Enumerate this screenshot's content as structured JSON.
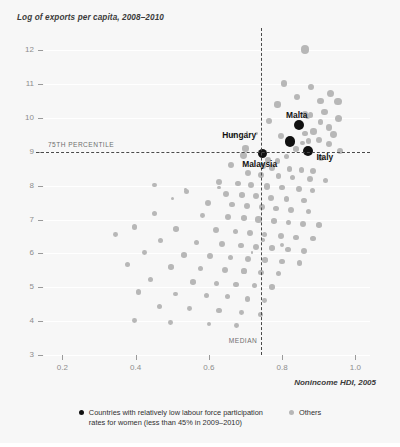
{
  "chart_data": {
    "type": "scatter",
    "title": "Log of exports per capita, 2008–2010",
    "xlabel": "Nonincome HDI, 2005",
    "ylabel": "Log of exports per capita, 2008–2010",
    "xlim": [
      0.15,
      1.04
    ],
    "ylim": [
      3,
      12.3
    ],
    "xticks": [
      "0.2",
      "0.4",
      "0.6",
      "0.8",
      "1.0"
    ],
    "xtick_values": [
      0.2,
      0.4,
      0.6,
      0.8,
      1.0
    ],
    "yticks": [
      "3",
      "4",
      "5",
      "6",
      "7",
      "8",
      "9",
      "10",
      "11",
      "12"
    ],
    "ytick_values": [
      3,
      4,
      5,
      6,
      7,
      8,
      9,
      10,
      11,
      12
    ],
    "grid": "horizontal-faint",
    "legend_position": "bottom-center",
    "reference_lines": [
      {
        "orientation": "horizontal",
        "value": 9.0,
        "label": "75TH PERCENTILE",
        "style": "dashed"
      },
      {
        "orientation": "vertical",
        "value": 0.742,
        "label": "MEDIAN",
        "style": "dashed"
      }
    ],
    "series": [
      {
        "name": "Countries with relatively low labour force participation rates for women (less than 45% in 2009–2010)",
        "color": "#111111",
        "points": [
          {
            "label": "Malta",
            "x": 0.845,
            "y": 9.78,
            "r": 5.0
          },
          {
            "label": "Hungary",
            "x": 0.822,
            "y": 9.3,
            "r": 5.2
          },
          {
            "label": "Italy",
            "x": 0.872,
            "y": 9.03,
            "r": 5.0
          },
          {
            "label": "Malaysia",
            "x": 0.747,
            "y": 8.95,
            "r": 4.8
          }
        ]
      },
      {
        "name": "Others",
        "color": "#b7b7b7",
        "points": [
          {
            "x": 0.862,
            "y": 12.02,
            "r": 4.2
          },
          {
            "x": 0.805,
            "y": 11.02,
            "r": 3.2
          },
          {
            "x": 0.878,
            "y": 10.92,
            "r": 3.0
          },
          {
            "x": 0.932,
            "y": 10.72,
            "r": 3.6
          },
          {
            "x": 0.84,
            "y": 10.62,
            "r": 3.0
          },
          {
            "x": 0.904,
            "y": 10.5,
            "r": 3.4
          },
          {
            "x": 0.952,
            "y": 10.48,
            "r": 3.8
          },
          {
            "x": 0.788,
            "y": 10.4,
            "r": 3.2
          },
          {
            "x": 0.916,
            "y": 10.18,
            "r": 3.2
          },
          {
            "x": 0.862,
            "y": 10.12,
            "r": 3.2
          },
          {
            "x": 0.878,
            "y": 10.08,
            "r": 2.8
          },
          {
            "x": 0.87,
            "y": 10.04,
            "r": 2.6
          },
          {
            "x": 0.955,
            "y": 9.98,
            "r": 3.6
          },
          {
            "x": 0.765,
            "y": 9.92,
            "r": 3.0
          },
          {
            "x": 0.905,
            "y": 9.88,
            "r": 2.6
          },
          {
            "x": 0.928,
            "y": 9.72,
            "r": 3.2
          },
          {
            "x": 0.886,
            "y": 9.6,
            "r": 3.2
          },
          {
            "x": 0.862,
            "y": 9.54,
            "r": 2.8
          },
          {
            "x": 0.94,
            "y": 9.5,
            "r": 3.4
          },
          {
            "x": 0.798,
            "y": 9.46,
            "r": 3.0
          },
          {
            "x": 0.9,
            "y": 9.36,
            "r": 3.0
          },
          {
            "x": 0.872,
            "y": 9.32,
            "r": 2.8
          },
          {
            "x": 0.855,
            "y": 9.26,
            "r": 2.4
          },
          {
            "x": 0.928,
            "y": 9.22,
            "r": 3.0
          },
          {
            "x": 0.7,
            "y": 9.1,
            "r": 3.2
          },
          {
            "x": 0.838,
            "y": 9.08,
            "r": 2.8
          },
          {
            "x": 0.958,
            "y": 9.02,
            "r": 3.0
          },
          {
            "x": 0.694,
            "y": 8.88,
            "r": 3.4
          },
          {
            "x": 0.812,
            "y": 8.86,
            "r": 2.6
          },
          {
            "x": 0.905,
            "y": 8.82,
            "r": 3.0
          },
          {
            "x": 0.762,
            "y": 8.76,
            "r": 3.0
          },
          {
            "x": 0.788,
            "y": 8.72,
            "r": 2.8
          },
          {
            "x": 0.66,
            "y": 8.6,
            "r": 3.0
          },
          {
            "x": 0.748,
            "y": 8.58,
            "r": 2.8
          },
          {
            "x": 0.772,
            "y": 8.54,
            "r": 3.2
          },
          {
            "x": 0.82,
            "y": 8.5,
            "r": 2.8
          },
          {
            "x": 0.852,
            "y": 8.46,
            "r": 2.6
          },
          {
            "x": 0.885,
            "y": 8.42,
            "r": 3.0
          },
          {
            "x": 0.706,
            "y": 8.36,
            "r": 3.0
          },
          {
            "x": 0.742,
            "y": 8.32,
            "r": 3.2
          },
          {
            "x": 0.79,
            "y": 8.28,
            "r": 2.8
          },
          {
            "x": 0.828,
            "y": 8.24,
            "r": 2.6
          },
          {
            "x": 0.876,
            "y": 8.2,
            "r": 3.0
          },
          {
            "x": 0.918,
            "y": 8.16,
            "r": 2.6
          },
          {
            "x": 0.628,
            "y": 8.1,
            "r": 3.2
          },
          {
            "x": 0.68,
            "y": 8.06,
            "r": 2.8
          },
          {
            "x": 0.716,
            "y": 8.02,
            "r": 3.0
          },
          {
            "x": 0.758,
            "y": 7.98,
            "r": 3.2
          },
          {
            "x": 0.8,
            "y": 7.94,
            "r": 2.8
          },
          {
            "x": 0.846,
            "y": 7.9,
            "r": 3.0
          },
          {
            "x": 0.884,
            "y": 7.86,
            "r": 2.6
          },
          {
            "x": 0.54,
            "y": 7.82,
            "r": 2.6
          },
          {
            "x": 0.648,
            "y": 7.76,
            "r": 3.0
          },
          {
            "x": 0.69,
            "y": 7.72,
            "r": 2.8
          },
          {
            "x": 0.73,
            "y": 7.68,
            "r": 3.0
          },
          {
            "x": 0.77,
            "y": 7.64,
            "r": 3.2
          },
          {
            "x": 0.812,
            "y": 7.6,
            "r": 2.8
          },
          {
            "x": 0.86,
            "y": 7.56,
            "r": 2.6
          },
          {
            "x": 0.598,
            "y": 7.48,
            "r": 3.0
          },
          {
            "x": 0.664,
            "y": 7.44,
            "r": 2.8
          },
          {
            "x": 0.704,
            "y": 7.4,
            "r": 3.0
          },
          {
            "x": 0.744,
            "y": 7.36,
            "r": 3.0
          },
          {
            "x": 0.784,
            "y": 7.32,
            "r": 2.8
          },
          {
            "x": 0.824,
            "y": 7.28,
            "r": 3.0
          },
          {
            "x": 0.872,
            "y": 7.24,
            "r": 2.6
          },
          {
            "x": 0.452,
            "y": 7.18,
            "r": 2.6
          },
          {
            "x": 0.582,
            "y": 7.12,
            "r": 2.4
          },
          {
            "x": 0.652,
            "y": 7.08,
            "r": 3.0
          },
          {
            "x": 0.696,
            "y": 7.04,
            "r": 2.8
          },
          {
            "x": 0.736,
            "y": 7.0,
            "r": 3.2
          },
          {
            "x": 0.778,
            "y": 6.96,
            "r": 2.8
          },
          {
            "x": 0.818,
            "y": 6.92,
            "r": 2.6
          },
          {
            "x": 0.856,
            "y": 6.88,
            "r": 3.0
          },
          {
            "x": 0.9,
            "y": 6.84,
            "r": 2.8
          },
          {
            "x": 0.398,
            "y": 6.78,
            "r": 2.6
          },
          {
            "x": 0.51,
            "y": 6.72,
            "r": 2.8
          },
          {
            "x": 0.62,
            "y": 6.68,
            "r": 3.0
          },
          {
            "x": 0.672,
            "y": 6.64,
            "r": 2.6
          },
          {
            "x": 0.712,
            "y": 6.6,
            "r": 3.0
          },
          {
            "x": 0.752,
            "y": 6.56,
            "r": 2.8
          },
          {
            "x": 0.796,
            "y": 6.52,
            "r": 3.0
          },
          {
            "x": 0.838,
            "y": 6.48,
            "r": 2.6
          },
          {
            "x": 0.884,
            "y": 6.44,
            "r": 2.8
          },
          {
            "x": 0.468,
            "y": 6.38,
            "r": 2.6
          },
          {
            "x": 0.566,
            "y": 6.32,
            "r": 2.8
          },
          {
            "x": 0.636,
            "y": 6.28,
            "r": 3.0
          },
          {
            "x": 0.688,
            "y": 6.24,
            "r": 2.6
          },
          {
            "x": 0.728,
            "y": 6.2,
            "r": 3.0
          },
          {
            "x": 0.772,
            "y": 6.16,
            "r": 2.8
          },
          {
            "x": 0.816,
            "y": 6.12,
            "r": 2.6
          },
          {
            "x": 0.86,
            "y": 6.08,
            "r": 3.0
          },
          {
            "x": 0.424,
            "y": 6.02,
            "r": 2.4
          },
          {
            "x": 0.532,
            "y": 5.96,
            "r": 2.8
          },
          {
            "x": 0.604,
            "y": 5.92,
            "r": 3.0
          },
          {
            "x": 0.66,
            "y": 5.88,
            "r": 2.6
          },
          {
            "x": 0.708,
            "y": 5.84,
            "r": 3.0
          },
          {
            "x": 0.754,
            "y": 5.8,
            "r": 2.8
          },
          {
            "x": 0.8,
            "y": 5.76,
            "r": 2.6
          },
          {
            "x": 0.848,
            "y": 5.72,
            "r": 2.8
          },
          {
            "x": 0.378,
            "y": 5.66,
            "r": 2.6
          },
          {
            "x": 0.496,
            "y": 5.6,
            "r": 2.8
          },
          {
            "x": 0.578,
            "y": 5.56,
            "r": 2.6
          },
          {
            "x": 0.644,
            "y": 5.52,
            "r": 3.0
          },
          {
            "x": 0.696,
            "y": 5.48,
            "r": 2.6
          },
          {
            "x": 0.742,
            "y": 5.44,
            "r": 2.8
          },
          {
            "x": 0.79,
            "y": 5.4,
            "r": 2.6
          },
          {
            "x": 0.44,
            "y": 5.22,
            "r": 2.6
          },
          {
            "x": 0.556,
            "y": 5.16,
            "r": 2.8
          },
          {
            "x": 0.62,
            "y": 5.12,
            "r": 2.6
          },
          {
            "x": 0.674,
            "y": 5.08,
            "r": 2.8
          },
          {
            "x": 0.724,
            "y": 5.04,
            "r": 2.6
          },
          {
            "x": 0.772,
            "y": 5.0,
            "r": 2.8
          },
          {
            "x": 0.408,
            "y": 4.86,
            "r": 2.6
          },
          {
            "x": 0.51,
            "y": 4.8,
            "r": 2.4
          },
          {
            "x": 0.594,
            "y": 4.76,
            "r": 2.8
          },
          {
            "x": 0.652,
            "y": 4.72,
            "r": 2.6
          },
          {
            "x": 0.706,
            "y": 4.66,
            "r": 2.8
          },
          {
            "x": 0.752,
            "y": 4.62,
            "r": 2.4
          },
          {
            "x": 0.466,
            "y": 4.44,
            "r": 2.6
          },
          {
            "x": 0.548,
            "y": 4.38,
            "r": 2.4
          },
          {
            "x": 0.628,
            "y": 4.32,
            "r": 2.6
          },
          {
            "x": 0.69,
            "y": 4.26,
            "r": 2.4
          },
          {
            "x": 0.742,
            "y": 4.2,
            "r": 2.6
          },
          {
            "x": 0.396,
            "y": 4.02,
            "r": 2.4
          },
          {
            "x": 0.496,
            "y": 3.96,
            "r": 2.4
          },
          {
            "x": 0.6,
            "y": 3.92,
            "r": 2.2
          },
          {
            "x": 0.676,
            "y": 3.86,
            "r": 2.4
          },
          {
            "x": 0.346,
            "y": 6.56,
            "r": 2.4
          },
          {
            "x": 0.452,
            "y": 8.02,
            "r": 2.4
          },
          {
            "x": 0.5,
            "y": 7.62,
            "r": 1.6
          },
          {
            "x": 0.536,
            "y": 7.88,
            "r": 1.4
          },
          {
            "x": 0.628,
            "y": 7.94,
            "r": 1.6
          },
          {
            "x": 0.666,
            "y": 9.5,
            "r": 1.6
          },
          {
            "x": 0.704,
            "y": 9.58,
            "r": 1.4
          },
          {
            "x": 0.73,
            "y": 9.54,
            "r": 1.4
          },
          {
            "x": 0.748,
            "y": 6.4,
            "r": 1.8
          },
          {
            "x": 0.718,
            "y": 6.02,
            "r": 1.4
          },
          {
            "x": 0.8,
            "y": 6.26,
            "r": 2.0
          }
        ]
      }
    ]
  },
  "legend": {
    "items": [
      {
        "marker": "dark-dot",
        "text": "Countries with relatively low labour force participation\nrates for women (less than 45% in 2009–2010)"
      },
      {
        "marker": "light-dot",
        "text": "Others"
      }
    ]
  }
}
